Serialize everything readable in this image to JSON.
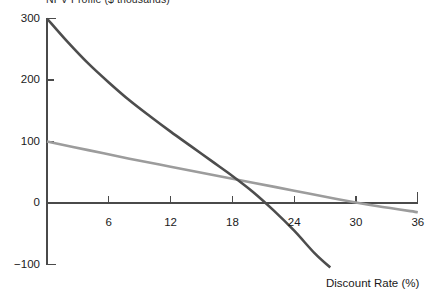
{
  "chart_data": {
    "type": "line",
    "title": "NPV Profile ($ thousands)",
    "title_clipped": true,
    "xlabel": "Discount Rate (%)",
    "ylabel": "",
    "xlim": [
      0,
      36
    ],
    "ylim": [
      -100,
      300
    ],
    "xticks": [
      6,
      12,
      18,
      24,
      30,
      36
    ],
    "yticks": [
      -100,
      0,
      100,
      200,
      300
    ],
    "xtick_labels": [
      "6",
      "12",
      "18",
      "24",
      "30",
      "36"
    ],
    "ytick_labels": [
      "−100",
      "0",
      "100",
      "200",
      "300"
    ],
    "grid": false,
    "legend": "none",
    "series": [
      {
        "name": "Project A",
        "color": "#4d4d4d",
        "width": 2.6,
        "x": [
          0,
          2,
          4,
          6,
          8,
          10,
          12,
          14,
          16,
          18,
          20,
          22,
          24,
          26,
          27.5
        ],
        "y": [
          300,
          262,
          227,
          196,
          167,
          141,
          116,
          92,
          68,
          44,
          18,
          -12,
          -45,
          -82,
          -105
        ]
      },
      {
        "name": "Project B",
        "color": "#9c9c9c",
        "width": 2.6,
        "x": [
          0,
          4,
          8,
          12,
          16,
          20,
          24,
          28,
          32,
          36
        ],
        "y": [
          100,
          86,
          72,
          59,
          46,
          33,
          20,
          7,
          -5,
          -15
        ]
      }
    ],
    "zero_crossings": [
      {
        "series": "Project A",
        "x": 16.9
      },
      {
        "series": "Project B",
        "x": 29.7
      }
    ],
    "intersection": {
      "x": 15.7,
      "y": 48
    }
  },
  "axes": {
    "x_title": "Discount Rate (%)"
  }
}
